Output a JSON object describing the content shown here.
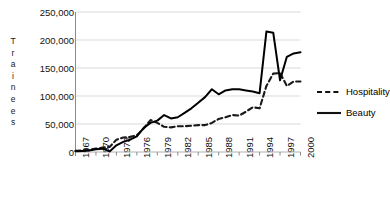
{
  "chart_data": {
    "type": "line",
    "title": "",
    "xlabel": "",
    "ylabel": "Trainees",
    "ylim": [
      0,
      250000
    ],
    "xlim": [
      1967,
      2000
    ],
    "grid": true,
    "legend_position": "right",
    "ytick_labels": [
      "250,000",
      "200,000",
      "150,000",
      "100,000",
      "50,000",
      "0"
    ],
    "ytick_values": [
      250000,
      200000,
      150000,
      100000,
      50000,
      0
    ],
    "xtick_labels": [
      "1967",
      "1970",
      "1973",
      "1976",
      "1979",
      "1982",
      "1985",
      "1988",
      "1991",
      "1994",
      "1997",
      "2000"
    ],
    "xtick_values": [
      1967,
      1970,
      1973,
      1976,
      1979,
      1982,
      1985,
      1988,
      1991,
      1994,
      1997,
      2000
    ],
    "x": [
      1967,
      1968,
      1969,
      1970,
      1971,
      1972,
      1973,
      1974,
      1975,
      1976,
      1977,
      1978,
      1979,
      1980,
      1981,
      1982,
      1983,
      1984,
      1985,
      1986,
      1987,
      1988,
      1989,
      1990,
      1991,
      1992,
      1993,
      1994,
      1995,
      1996,
      1997,
      1998,
      1999,
      2000
    ],
    "series": [
      {
        "name": "Hospitality",
        "style": "dashed",
        "color": "#1a1a1a",
        "values": [
          2000,
          3000,
          4000,
          6000,
          8000,
          9000,
          22000,
          26000,
          27000,
          30000,
          42000,
          57000,
          52000,
          45000,
          44000,
          46000,
          46000,
          47000,
          48000,
          48000,
          52000,
          59000,
          62000,
          66000,
          65000,
          72000,
          80000,
          78000,
          118000,
          140000,
          141000,
          118000,
          126000,
          126000
        ]
      },
      {
        "name": "Beauty",
        "style": "solid",
        "color": "#000000",
        "values": [
          1500,
          2000,
          2500,
          5000,
          6000,
          1000,
          12000,
          18000,
          22000,
          28000,
          43000,
          52000,
          56000,
          66000,
          60000,
          62000,
          70000,
          78000,
          88000,
          98000,
          112000,
          103000,
          110000,
          112000,
          112000,
          110000,
          108000,
          105000,
          215000,
          213000,
          128000,
          170000,
          176000,
          178000
        ]
      }
    ]
  },
  "legend": {
    "items": [
      {
        "label": "Hospitality",
        "style": "dashed"
      },
      {
        "label": "Beauty",
        "style": "solid"
      }
    ]
  },
  "axis": {
    "y_title_letters": [
      "T",
      "r",
      "a",
      "i",
      "n",
      "e",
      "e",
      "s"
    ]
  }
}
